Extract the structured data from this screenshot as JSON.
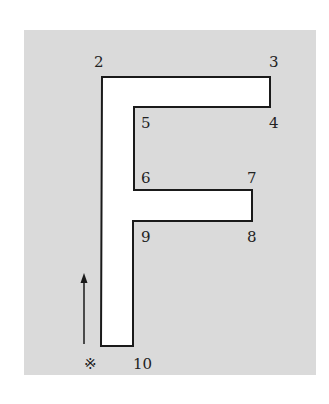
{
  "diagram": {
    "shape": "F",
    "path_points": [
      {
        "label": "2",
        "x": 102,
        "y": 77
      },
      {
        "label": "3",
        "x": 270,
        "y": 77
      },
      {
        "label": "4",
        "x": 270,
        "y": 107
      },
      {
        "label": "5",
        "x": 134,
        "y": 107
      },
      {
        "label": "6",
        "x": 134,
        "y": 190
      },
      {
        "label": "7",
        "x": 252,
        "y": 190
      },
      {
        "label": "8",
        "x": 252,
        "y": 221
      },
      {
        "label": "9",
        "x": 133,
        "y": 221
      },
      {
        "label": "10",
        "x": 133,
        "y": 346
      },
      {
        "label": "start",
        "x": 101,
        "y": 346
      }
    ],
    "labels": [
      {
        "text": "2",
        "x": 94,
        "y": 67
      },
      {
        "text": "3",
        "x": 269,
        "y": 67
      },
      {
        "text": "4",
        "x": 269,
        "y": 128
      },
      {
        "text": "5",
        "x": 141,
        "y": 128
      },
      {
        "text": "6",
        "x": 141,
        "y": 183
      },
      {
        "text": "7",
        "x": 247,
        "y": 183
      },
      {
        "text": "8",
        "x": 247,
        "y": 242
      },
      {
        "text": "9",
        "x": 141,
        "y": 242
      },
      {
        "text": "10",
        "x": 133,
        "y": 369
      }
    ],
    "start_marker": {
      "symbol": "※",
      "x": 84,
      "y": 369
    },
    "arrow": {
      "x": 84,
      "y1": 344,
      "y2": 273,
      "direction": "up"
    },
    "colors": {
      "panel": "#dadada",
      "shape_fill": "#ffffff",
      "stroke": "#1a1a1a"
    }
  }
}
